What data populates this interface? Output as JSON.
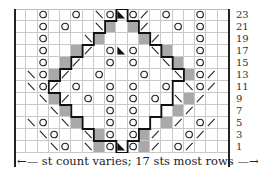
{
  "chart": {
    "columns": 19,
    "rows_shown": [
      23,
      21,
      19,
      17,
      15,
      13,
      11,
      9,
      7,
      5,
      3,
      1
    ],
    "legend_symbols": {
      ".": "knit (empty)",
      "O": "yarn over",
      "\\": "ssk / left-leaning decrease",
      "/": "k2tog / right-leaning decrease",
      "G": "no stitch (gray)",
      "T": "centered double decrease (black triangle)"
    },
    "grid": [
      "..O..O.\\OTO/.O..O..",
      "..O.O..\\G.G/..O.O..",
      "..O...\\G...G/...O..",
      "..O..G/.OTO.\\G..O..",
      "..O.G/..O.O..\\G.O..",
      ".\\OG/..O...O..\\GO/.",
      ".\\O/.O..O.O..O.\\O/.",
      "..\\G/.O.O.O.O.\\G/..",
      "...\\G...O.O...G/...",
      ".\\O.\\G..O.O..G/.O/.",
      "..\\O..\\GO.OG/..O/..",
      "...\\O.\\GOTOG/.O/..."
    ],
    "caption": "st count varies; 17 sts most rows",
    "arrow_left": "←",
    "arrow_right": "→",
    "colors": {
      "gray": "#a9a9a9",
      "grid": "#c9c9c9",
      "ink": "#222222"
    }
  }
}
